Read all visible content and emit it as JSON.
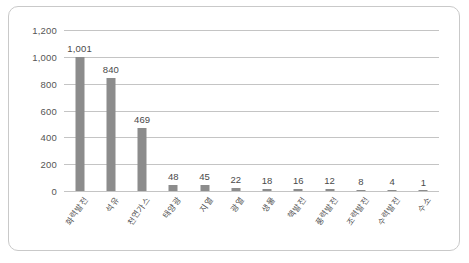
{
  "chart_data": {
    "type": "bar",
    "title": "",
    "subtitle": "",
    "xlabel": "",
    "ylabel": "",
    "ylim": [
      0,
      1200
    ],
    "yticks": [
      0,
      200,
      400,
      600,
      800,
      1000,
      1200
    ],
    "ytick_labels": [
      "0",
      "200",
      "400",
      "600",
      "800",
      "1,000",
      "1,200"
    ],
    "grid": true,
    "legend": false,
    "bar_color": "#8c8c8c",
    "categories": [
      "화력발전",
      "석유",
      "천연가스",
      "태양광",
      "지열",
      "광열",
      "생물",
      "핵발전",
      "풍력발전",
      "조력발전",
      "수력발전",
      "수소"
    ],
    "values": [
      1001,
      840,
      469,
      48,
      45,
      22,
      18,
      16,
      12,
      8,
      4,
      1
    ],
    "value_labels": [
      "1,001",
      "840",
      "469",
      "48",
      "45",
      "22",
      "18",
      "16",
      "12",
      "8",
      "4",
      "1"
    ]
  },
  "figure": {
    "caption": ""
  }
}
